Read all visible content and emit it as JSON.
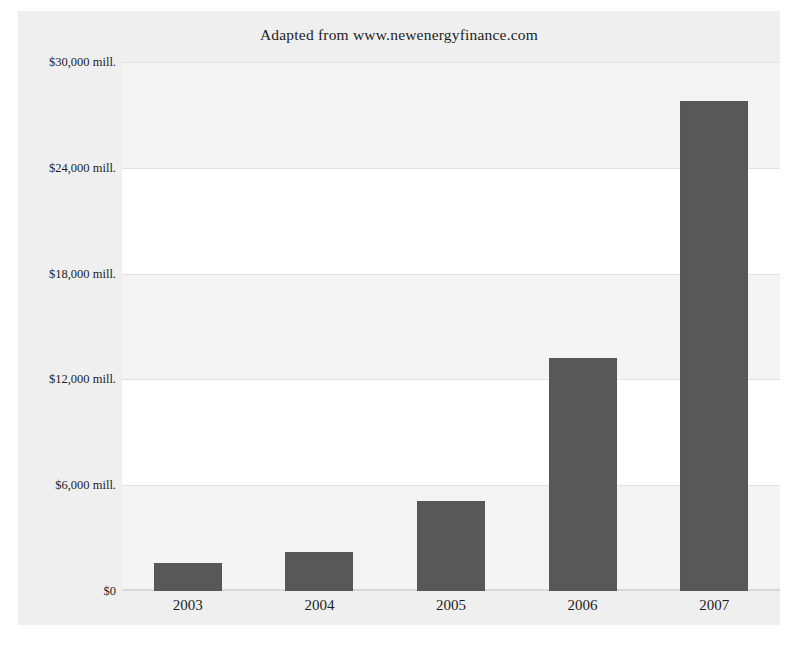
{
  "chart_data": {
    "type": "bar",
    "title": "Adapted from www.newenergyfinance.com",
    "xlabel": "",
    "ylabel": "",
    "categories": [
      "2003",
      "2004",
      "2005",
      "2006",
      "2007"
    ],
    "values": [
      1600,
      2200,
      5100,
      13200,
      27800
    ],
    "value_unit": "$ mill.",
    "ylim": [
      0,
      30000
    ],
    "ytick_values": [
      0,
      6000,
      12000,
      18000,
      24000,
      30000
    ],
    "ytick_labels": [
      "$0",
      "$6,000 mill.",
      "$12,000 mill.",
      "$18,000 mill.",
      "$24,000 mill.",
      "$30,000 mill."
    ],
    "grid": true,
    "legend": "none",
    "series": [
      {
        "name": "Investment",
        "values": [
          1600,
          2200,
          5100,
          13200,
          27800
        ]
      }
    ]
  },
  "style": {
    "bar_color": "#585858",
    "plot_background": "#ffffff",
    "frame_background": "#efefef",
    "gridline_color": "#e2e2e2",
    "band_color": "#f4f4f4",
    "text_color": "#1d1d1d"
  }
}
